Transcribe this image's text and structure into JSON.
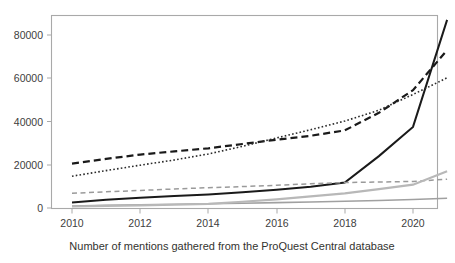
{
  "figure": {
    "caption": "Number of mentions gathered from the ProQuest Central database",
    "background_color": "#ffffff",
    "border_color": "#a9a9a9"
  },
  "chart_data": {
    "type": "line",
    "title": "",
    "subtitle": "",
    "caption": "Number of mentions gathered from the ProQuest Central database",
    "xlabel": "",
    "ylabel": "",
    "grid": false,
    "legend": "none",
    "xlim": [
      2010,
      2021
    ],
    "ylim": [
      0,
      88000
    ],
    "x_ticks": [
      2010,
      2012,
      2014,
      2016,
      2018,
      2020
    ],
    "x_tick_labels": [
      "2010",
      "2012",
      "2014",
      "2016",
      "2018",
      "2020"
    ],
    "y_ticks": [
      0,
      20000,
      40000,
      60000,
      80000
    ],
    "y_tick_labels": [
      "0",
      "20000",
      "40000",
      "60000",
      "80000"
    ],
    "x": [
      2010,
      2011,
      2012,
      2013,
      2014,
      2015,
      2016,
      2017,
      2018,
      2019,
      2020,
      2021
    ],
    "series": [
      {
        "name": "series-black-solid",
        "style": "solid",
        "color": "#1a1a1a",
        "width": 2.0,
        "values": [
          2600,
          3800,
          4700,
          5500,
          6300,
          7300,
          8400,
          9800,
          11800,
          24000,
          37500,
          87000
        ]
      },
      {
        "name": "series-black-dashed",
        "style": "dashed",
        "color": "#1a1a1a",
        "width": 2.2,
        "values": [
          20500,
          22700,
          24700,
          26200,
          27600,
          29600,
          31600,
          33400,
          35900,
          44000,
          54500,
          73000
        ]
      },
      {
        "name": "series-black-dotted",
        "style": "dotted",
        "color": "#2b2b2b",
        "width": 1.6,
        "values": [
          14700,
          17300,
          19800,
          22200,
          25000,
          28500,
          32400,
          36200,
          40200,
          45200,
          52500,
          60200
        ]
      },
      {
        "name": "series-gray-dashed",
        "style": "dashed",
        "color": "#9a9a9a",
        "width": 1.5,
        "values": [
          6800,
          7500,
          8100,
          8800,
          9400,
          9900,
          10500,
          11200,
          11800,
          12000,
          12300,
          13300
        ]
      },
      {
        "name": "series-gray-solid",
        "style": "solid",
        "color": "#a0a0a0",
        "width": 1.6,
        "values": [
          900,
          1200,
          1450,
          1700,
          1950,
          2200,
          2500,
          2800,
          3100,
          3500,
          3900,
          4500
        ]
      },
      {
        "name": "series-lightgray-solid",
        "style": "solid",
        "color": "#b8b8b8",
        "width": 2.2,
        "values": [
          700,
          950,
          1200,
          1500,
          1900,
          2900,
          4000,
          5400,
          6800,
          8700,
          10800,
          17000
        ]
      }
    ]
  },
  "axes": {
    "x_axis_name": "year-axis",
    "y_axis_name": "mentions-axis"
  }
}
